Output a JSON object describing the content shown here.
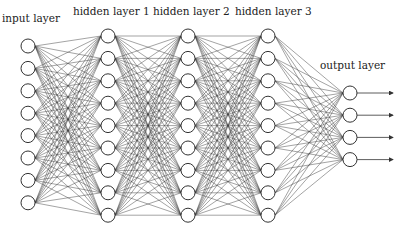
{
  "diagram": {
    "colors": {
      "background": "#ffffff",
      "edge": "#3a3a3a",
      "node_stroke": "#333333",
      "node_fill": "#ffffff",
      "text": "#222222"
    },
    "layers": [
      {
        "label": "input layer",
        "nodes": 8,
        "x": 28,
        "y_start": 46,
        "spacing": 22.4,
        "label_x": 2,
        "label_y": 13
      },
      {
        "label": "hidden layer 1",
        "nodes": 9,
        "x": 108,
        "y_start": 36,
        "spacing": 22.4,
        "label_x": 73,
        "label_y": 6
      },
      {
        "label": "hidden layer 2",
        "nodes": 9,
        "x": 188,
        "y_start": 36,
        "spacing": 22.4,
        "label_x": 153,
        "label_y": 6
      },
      {
        "label": "hidden layer 3",
        "nodes": 9,
        "x": 268,
        "y_start": 36,
        "spacing": 22.4,
        "label_x": 235,
        "label_y": 6
      },
      {
        "label": "output layer",
        "nodes": 4,
        "x": 350,
        "y_start": 93,
        "spacing": 22.2,
        "label_x": 320,
        "label_y": 60
      }
    ],
    "node_radius": 7,
    "output_arrow_length": 36,
    "connectivity": "fully-connected"
  }
}
